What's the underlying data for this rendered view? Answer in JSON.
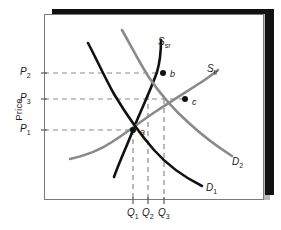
{
  "figure": {
    "background_color": "#ffffff",
    "panel_color": "#ffffff",
    "shadow_color": "#111111",
    "shadow_soft_color": "#b9b9b9",
    "border_color": "#7a7a7a"
  },
  "chart_data": {
    "type": "line",
    "title": "",
    "xlabel": "",
    "ylabel": "Price",
    "grid": false,
    "legend_position": "inline-curve-labels",
    "axis_tick_labels": {
      "y": [
        "P2",
        "P3",
        "P1"
      ],
      "x": [
        "Q1",
        "Q2",
        "Q3"
      ]
    },
    "y_ticks": [
      {
        "label": "P",
        "sub": "2",
        "value_px_y": 73
      },
      {
        "label": "P",
        "sub": "3",
        "value_px_y": 99
      },
      {
        "label": "P",
        "sub": "1",
        "value_px_y": 130
      }
    ],
    "x_ticks": [
      {
        "label": "Q",
        "sub": "1",
        "value_px_x": 133
      },
      {
        "label": "Q",
        "sub": "2",
        "value_px_x": 148
      },
      {
        "label": "Q",
        "sub": "3",
        "value_px_x": 164
      }
    ],
    "series": [
      {
        "name": "S",
        "sub": "sr",
        "role": "short-run-supply",
        "color": "#111111",
        "width": 2.6,
        "label_x": 158,
        "label_y": 36,
        "path": "M 114,177 C 120,160 127,146 133,130 C 140,112 150,92 157,72 C 160,62 161,50 161,40"
      },
      {
        "name": "S",
        "sub": "lr",
        "role": "long-run-supply",
        "color": "#8a8a8a",
        "width": 2.6,
        "label_x": 207,
        "label_y": 63,
        "path": "M 70,159 C 84,156 100,150 112,142 C 126,133 140,122 155,112 C 170,102 186,92 200,83 C 208,78 213,74 218,70"
      },
      {
        "name": "D",
        "sub": "1",
        "role": "demand-initial",
        "color": "#111111",
        "width": 2.6,
        "label_x": 206,
        "label_y": 182,
        "path": "M 88,43 C 96,58 104,76 114,94 C 126,114 140,134 154,150 C 168,166 182,176 202,186"
      },
      {
        "name": "D",
        "sub": "2",
        "role": "demand-shifted",
        "color": "#8a8a8a",
        "width": 2.6,
        "label_x": 232,
        "label_y": 156,
        "path": "M 122,30 C 130,44 138,60 148,76 C 160,94 174,110 190,124 C 204,137 218,147 232,156"
      }
    ],
    "points": [
      {
        "label": "a",
        "x_px": 133,
        "y_px": 130,
        "desc": "initial equilibrium P1,Q1",
        "lx": 140,
        "ly": 127
      },
      {
        "label": "b",
        "x_px": 163,
        "y_px": 73,
        "desc": "short-run equilibrium P2,Q2",
        "lx": 170,
        "ly": 69
      },
      {
        "label": "c",
        "x_px": 185,
        "y_px": 99,
        "desc": "long-run equilibrium P3,Q3",
        "lx": 192,
        "ly": 97
      }
    ],
    "guide_lines": {
      "color": "#8a8a8a",
      "dash": "5,4",
      "horizontal": [
        {
          "y_px": 73,
          "x_from": 44,
          "x_to": 163
        },
        {
          "y_px": 99,
          "x_from": 44,
          "x_to": 185
        },
        {
          "y_px": 130,
          "x_from": 44,
          "x_to": 133
        }
      ],
      "vertical": [
        {
          "x_px": 133,
          "y_from": 130,
          "y_to": 200
        },
        {
          "x_px": 148,
          "y_from": 95,
          "y_to": 200
        },
        {
          "x_px": 164,
          "y_from": 99,
          "y_to": 200
        }
      ]
    },
    "axis_ticks_marks": {
      "color": "#5a5a5a",
      "y": [
        73,
        99,
        130
      ],
      "x": [
        133,
        148,
        164
      ]
    }
  }
}
